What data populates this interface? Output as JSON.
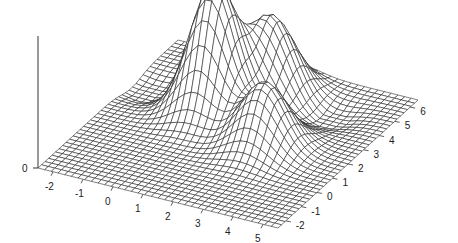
{
  "chart_data": {
    "type": "surface",
    "title": "",
    "xlabel": "",
    "ylabel": "",
    "zlabel": "",
    "x_ticks": [
      "-2",
      "-1",
      "0",
      "1",
      "2",
      "3",
      "4",
      "5"
    ],
    "y_ticks": [
      "-2",
      "-1",
      "0",
      "1",
      "2",
      "3",
      "4",
      "5",
      "6"
    ],
    "z_ticks": [
      "0"
    ],
    "xlim": [
      -2.5,
      5.5
    ],
    "ylim": [
      -2.5,
      6.5
    ],
    "grid": false,
    "legend": null,
    "surface": {
      "style": "wireframe mesh",
      "grid_resolution": [
        36,
        40
      ],
      "components": [
        {
          "description": "tallest peak",
          "center_x": 0.5,
          "center_y": 3.0,
          "relative_height": 1.0
        },
        {
          "description": "secondary peak behind",
          "center_x": 1.5,
          "center_y": 4.8,
          "relative_height": 0.6
        },
        {
          "description": "front bump",
          "center_x": 2.8,
          "center_y": 1.8,
          "relative_height": 0.5
        },
        {
          "description": "dip/trough left",
          "center_x": -1.8,
          "center_y": 3.5,
          "relative_height": -0.08
        },
        {
          "description": "dip/trough right",
          "center_x": 3.5,
          "center_y": 4.5,
          "relative_height": -0.08
        }
      ]
    },
    "colors": {
      "line": "#1a1a1a",
      "background": "#ffffff"
    }
  }
}
